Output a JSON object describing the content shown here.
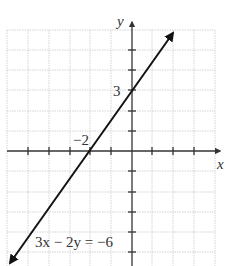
{
  "graph": {
    "equation": "3x − 2y = −6",
    "x_axis_label": "x",
    "y_axis_label": "y",
    "x_intercept_label": "−2",
    "y_intercept_label": "3",
    "x_intercept": -2,
    "y_intercept": 3,
    "slope": 1.5,
    "grid": {
      "x_range": [
        -6,
        4
      ],
      "y_range": [
        -5,
        6
      ],
      "unit": "1"
    },
    "colors": {
      "line": "#111111",
      "grid": "#c8c8c8",
      "axis": "#333333"
    }
  }
}
